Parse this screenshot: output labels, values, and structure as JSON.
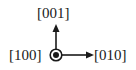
{
  "diagram": {
    "type": "crystallographic-axes",
    "labels": {
      "up": "[001]",
      "out_of_page": "[100]",
      "right": "[010]"
    },
    "colors": {
      "stroke": "#1a1a1a",
      "background": "#ffffff"
    }
  }
}
